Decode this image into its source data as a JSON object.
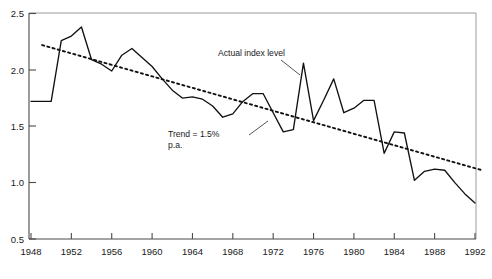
{
  "chart_data": {
    "type": "line",
    "title": "",
    "subtitle": "",
    "xlabel": "",
    "ylabel": "",
    "xlim": [
      1948,
      1992
    ],
    "ylim": [
      0.5,
      2.5
    ],
    "grid": false,
    "legend_position": "none",
    "x_tick_labels": [
      "1948",
      "1952",
      "1956",
      "1960",
      "1964",
      "1968",
      "1972",
      "1976",
      "1980",
      "1984",
      "1988",
      "1992"
    ],
    "x_ticks": [
      1948,
      1952,
      1956,
      1960,
      1964,
      1968,
      1972,
      1976,
      1980,
      1984,
      1988,
      1992
    ],
    "y_tick_labels": [
      "0.5",
      "1.0",
      "1.5",
      "2.0",
      "2.5"
    ],
    "y_ticks": [
      0.5,
      1.0,
      1.5,
      2.0,
      2.5
    ],
    "x": [
      1948,
      1949,
      1950,
      1951,
      1952,
      1953,
      1954,
      1955,
      1956,
      1957,
      1958,
      1959,
      1960,
      1961,
      1962,
      1963,
      1964,
      1965,
      1966,
      1967,
      1968,
      1969,
      1970,
      1971,
      1972,
      1973,
      1974,
      1975,
      1976,
      1977,
      1978,
      1979,
      1980,
      1981,
      1982,
      1983,
      1984,
      1985,
      1986,
      1987,
      1988,
      1989,
      1990,
      1991,
      1992
    ],
    "series": [
      {
        "name": "Actual index level",
        "style": "solid",
        "color": "#111111",
        "values": [
          1.72,
          1.72,
          1.72,
          2.26,
          2.3,
          2.38,
          2.09,
          2.05,
          1.99,
          2.13,
          2.19,
          2.11,
          2.03,
          1.92,
          1.82,
          1.75,
          1.76,
          1.74,
          1.68,
          1.58,
          1.61,
          1.72,
          1.79,
          1.79,
          1.62,
          1.45,
          1.47,
          2.06,
          1.55,
          1.73,
          1.92,
          1.62,
          1.66,
          1.73,
          1.73,
          1.26,
          1.45,
          1.44,
          1.02,
          1.1,
          1.12,
          1.11,
          1.0,
          0.9,
          0.82
        ]
      },
      {
        "name": "Trend = 1.5% p.a.",
        "style": "dotted",
        "color": "#111111",
        "x_endpoints": [
          1949.1,
          1992.7
        ],
        "y_endpoints": [
          2.22,
          1.11
        ]
      }
    ],
    "annotations": [
      {
        "name": "actual-index-level",
        "text": "Actual index level",
        "text_x": 218,
        "text_y": 56,
        "leader": [
          [
            281,
            60
          ],
          [
            300,
            75
          ]
        ]
      },
      {
        "name": "trend-label",
        "line1": "Trend = 1.5%",
        "line2": "p.a.",
        "text_x": 168,
        "text_y": 137,
        "leader": [
          [
            249,
            135
          ],
          [
            268,
            121
          ]
        ]
      }
    ]
  },
  "axis": {
    "y_axis_name": "y-axis",
    "x_axis_name": "x-axis"
  }
}
